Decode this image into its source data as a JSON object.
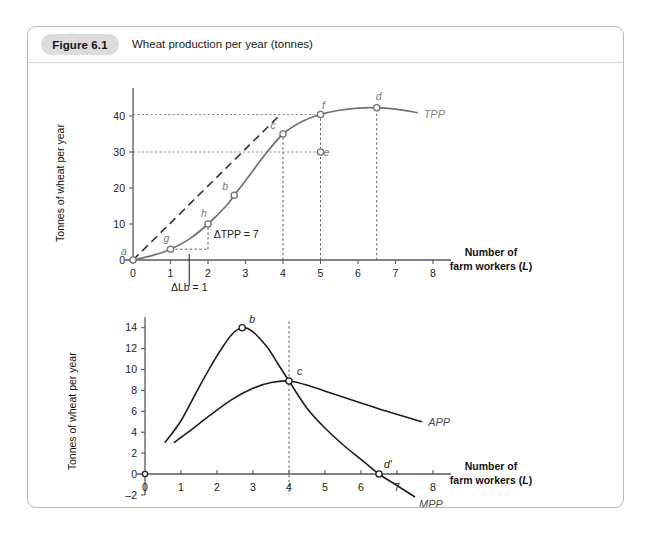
{
  "figure": {
    "badge": "Figure 6.1",
    "caption": "Wheat production per year (tonnes)"
  },
  "chart_data": [
    {
      "type": "line",
      "name": "top-tpp-chart",
      "title": "Wheat production per year (tonnes)",
      "xlabel_line1": "Number of",
      "xlabel_line2": "farm workers (",
      "xlabel_italic": "L",
      "xlabel_close": ")",
      "ylabel": "Tonnes of wheat  per year",
      "xlim": [
        0,
        8
      ],
      "ylim": [
        0,
        45
      ],
      "xticks": [
        0,
        1,
        2,
        3,
        4,
        5,
        6,
        7,
        8
      ],
      "xticklabels": [
        "0",
        "1",
        "2",
        "3",
        "4",
        "5",
        "6",
        "7",
        "8"
      ],
      "yticks": [
        0,
        10,
        20,
        30,
        40
      ],
      "yticklabels": [
        "0",
        "10",
        "20",
        "30",
        "40"
      ],
      "grid": false,
      "series": [
        {
          "name": "TPP",
          "label": "TPP",
          "points": [
            [
              0,
              0
            ],
            [
              0.5,
              1.2
            ],
            [
              1,
              3
            ],
            [
              1.5,
              5.8
            ],
            [
              2,
              10
            ],
            [
              2.5,
              15.2
            ],
            [
              2.7,
              18
            ],
            [
              3,
              22
            ],
            [
              3.5,
              29
            ],
            [
              4,
              35
            ],
            [
              4.5,
              38.4
            ],
            [
              5,
              40.4
            ],
            [
              5.5,
              41.6
            ],
            [
              6,
              42.2
            ],
            [
              6.5,
              42.3
            ],
            [
              7,
              41.9
            ],
            [
              7.6,
              40.9
            ]
          ]
        },
        {
          "name": "ray-from-origin",
          "label": "",
          "style": "dashed",
          "points": [
            [
              0,
              0
            ],
            [
              3.95,
              40.6
            ]
          ]
        }
      ],
      "labelled_points": [
        {
          "id": "a",
          "label": "a",
          "x": 0,
          "y": 0,
          "label_dx": -9,
          "label_dy": -5
        },
        {
          "id": "g",
          "label": "g",
          "x": 1,
          "y": 3,
          "label_dx": -4,
          "label_dy": -7
        },
        {
          "id": "h",
          "label": "h",
          "x": 2,
          "y": 10,
          "label_dx": -4,
          "label_dy": -7
        },
        {
          "id": "b",
          "label": "b",
          "x": 2.7,
          "y": 18,
          "label_dx": -9,
          "label_dy": -5
        },
        {
          "id": "c",
          "label": "c",
          "x": 4,
          "y": 35,
          "label_dx": -10,
          "label_dy": -5
        },
        {
          "id": "f",
          "label": "f",
          "x": 5,
          "y": 40.4,
          "label_dx": 3,
          "label_dy": -6
        },
        {
          "id": "e",
          "label": "e",
          "x": 5,
          "y": 30,
          "label_dx": 6,
          "label_dy": 4
        },
        {
          "id": "d",
          "label": "d",
          "x": 6.5,
          "y": 42.3,
          "label_dx": 2,
          "label_dy": -8
        }
      ],
      "gridlines_h": [
        {
          "y": 40.4,
          "x_from": 0,
          "x_to": 5
        },
        {
          "y": 30,
          "x_from": 0,
          "x_to": 5
        }
      ],
      "droplines_v": [
        {
          "x": 4,
          "y_from": 0,
          "y_to": 35
        },
        {
          "x": 5,
          "y_from": 0,
          "y_to": 40.4
        },
        {
          "x": 6.5,
          "y_from": 0,
          "y_to": 42.3
        }
      ],
      "annotations": [
        {
          "id": "delta-tpp",
          "text": "ΔTPP = 7",
          "x": 2.15,
          "y": 6.2
        },
        {
          "id": "delta-lb",
          "text": "ΔLb = 1",
          "x": 1.5,
          "y": -9.5
        }
      ]
    },
    {
      "type": "line",
      "name": "bottom-app-mpp-chart",
      "xlabel_line1": "Number of",
      "xlabel_line2": "farm workers (",
      "xlabel_italic": "L",
      "xlabel_close": ")",
      "ylabel": "Tonnes of wheat  per year",
      "xlim": [
        0,
        8
      ],
      "ylim": [
        -2,
        15
      ],
      "xticks": [
        0,
        1,
        2,
        3,
        4,
        5,
        6,
        7,
        8
      ],
      "xticklabels": [
        "0",
        "1",
        "2",
        "3",
        "4",
        "5",
        "6",
        "7",
        "8"
      ],
      "yticks": [
        -2,
        0,
        2,
        4,
        6,
        8,
        10,
        12,
        14
      ],
      "yticklabels": [
        "–2",
        "0",
        "2",
        "4",
        "6",
        "8",
        "10",
        "12",
        "14"
      ],
      "grid": false,
      "series": [
        {
          "name": "MPP",
          "label": "MPP",
          "points": [
            [
              0.55,
              3
            ],
            [
              1,
              5.1
            ],
            [
              1.5,
              8.3
            ],
            [
              2,
              11.3
            ],
            [
              2.4,
              13.3
            ],
            [
              2.7,
              14
            ],
            [
              3,
              13.6
            ],
            [
              3.4,
              12.1
            ],
            [
              3.7,
              10.5
            ],
            [
              4,
              8.9
            ],
            [
              4.5,
              6.3
            ],
            [
              5,
              4.4
            ],
            [
              5.5,
              2.8
            ],
            [
              6,
              1.4
            ],
            [
              6.5,
              0
            ],
            [
              7,
              -1.1
            ],
            [
              7.5,
              -2.2
            ]
          ]
        },
        {
          "name": "APP",
          "label": "APP",
          "points": [
            [
              0.8,
              3
            ],
            [
              1.2,
              4
            ],
            [
              1.8,
              5.6
            ],
            [
              2.4,
              7.1
            ],
            [
              3,
              8.2
            ],
            [
              3.5,
              8.75
            ],
            [
              4,
              8.9
            ],
            [
              4.6,
              8.4
            ],
            [
              5.2,
              7.7
            ],
            [
              6,
              6.8
            ],
            [
              6.8,
              5.9
            ],
            [
              7.7,
              5.0
            ]
          ]
        }
      ],
      "labelled_points": [
        {
          "id": "b",
          "label": "b",
          "x": 2.7,
          "y": 14,
          "label_dx": 4,
          "label_dy": -5
        },
        {
          "id": "c",
          "label": "c",
          "x": 4,
          "y": 8.9,
          "label_dx": 5,
          "label_dy": -6
        },
        {
          "id": "dprime",
          "label": "d′",
          "x": 6.5,
          "y": 0,
          "label_dx": 2,
          "label_dy": -6
        }
      ],
      "droplines_v": [
        {
          "x": 4,
          "y_from": -2,
          "y_to": 14.6
        }
      ]
    }
  ]
}
